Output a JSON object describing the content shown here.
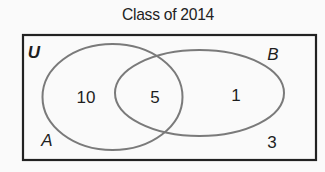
{
  "title": "Class of 2014",
  "universe": {
    "label": "U",
    "outside_count": "3"
  },
  "sets": [
    {
      "label": "A",
      "only_count": "10"
    },
    {
      "label": "B",
      "only_count": "1"
    }
  ],
  "intersection": {
    "sets": [
      "A",
      "B"
    ],
    "count": "5"
  },
  "colors": {
    "background": "#fafafa",
    "rectangle_border": "#222222",
    "ellipse_stroke": "#7a7a7a",
    "text": "#1e1e1e"
  }
}
